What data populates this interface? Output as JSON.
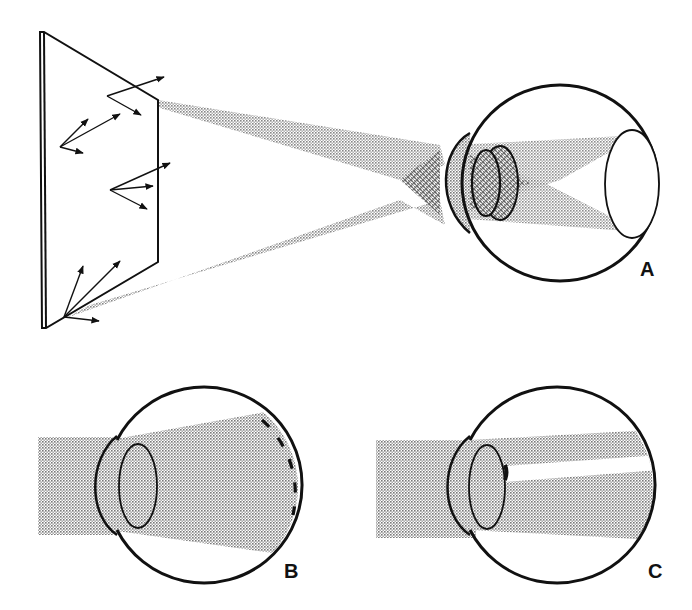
{
  "figure": {
    "panels": [
      {
        "id": "A",
        "label": "A",
        "description": "Light from a flat reflecting surface converges through cornea and lens, crossing and projecting an inverted image onto the retina"
      },
      {
        "id": "B",
        "label": "B",
        "description": "Parallel beam enters cornea and lens and spreads across the retina (dashed retina segment)"
      },
      {
        "id": "C",
        "label": "C",
        "description": "Parallel beam through cornea and lens with an opaque spot on the lens casting a shadow streak"
      }
    ],
    "colors": {
      "ink": "#111111",
      "stipple": "#9a9a9a",
      "background": "#ffffff"
    }
  }
}
